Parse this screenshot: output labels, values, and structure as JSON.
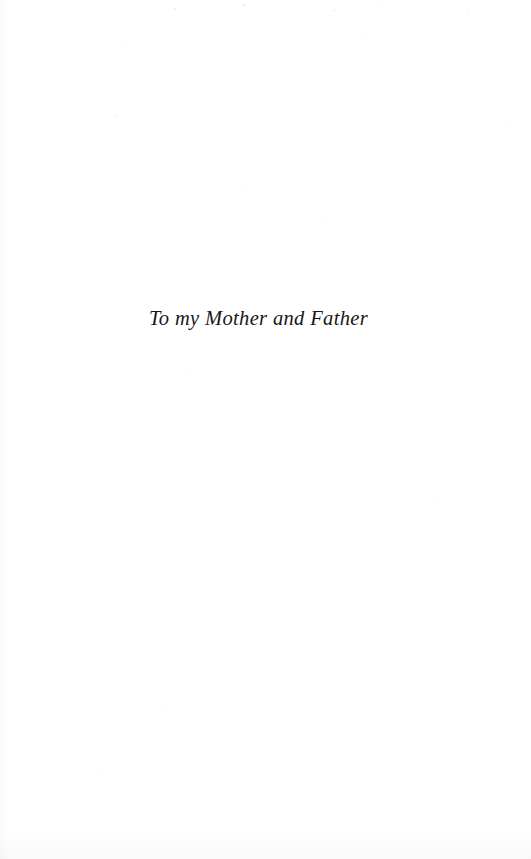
{
  "page": {
    "kind": "book-dedication-page",
    "background_color": "#ffffff",
    "ink_color": "#171717",
    "width_px": 531,
    "height_px": 859
  },
  "dedication": {
    "text": "To my Mother and Father",
    "style": "italic-serif",
    "alignment": "center"
  }
}
